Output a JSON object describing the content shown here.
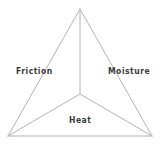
{
  "diagram": {
    "type": "tetrahedron-triangle",
    "colors": {
      "line": "#b4b4b4",
      "text": "#3a3a3a",
      "background": "#ffffff"
    },
    "vertices": {
      "apex": [
        80,
        9
      ],
      "center": [
        80,
        94
      ],
      "bottom_left": [
        8,
        136
      ],
      "bottom_right": [
        152,
        136
      ]
    },
    "faces": [
      {
        "id": "left",
        "label": "Friction"
      },
      {
        "id": "right",
        "label": "Moisture"
      },
      {
        "id": "bottom",
        "label": "Heat"
      }
    ]
  }
}
